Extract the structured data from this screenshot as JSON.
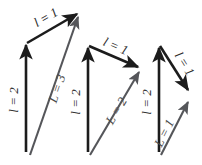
{
  "figure": {
    "type": "vector-addition-diagram-set",
    "background_color": "#ffffff",
    "component_color": "#1c1c1c",
    "resultant_color": "#55565a",
    "label_color": "#2b2b2b",
    "panel_count": 3
  },
  "panels": [
    {
      "id": "panel-1",
      "name": "vector-diagram-parallel",
      "vectors": {
        "vertical": {
          "name": "component-vertical",
          "label": "l = 2",
          "length": 2,
          "symbol": "l",
          "value": "2",
          "start": [
            26,
            152
          ],
          "end": [
            26,
            43
          ],
          "color": "#1c1c1c"
        },
        "second": {
          "name": "component-upper",
          "label": "l = 1",
          "length": 1,
          "symbol": "l",
          "value": "1",
          "start": [
            26,
            43
          ],
          "end": [
            79,
            13
          ],
          "color": "#1c1c1c"
        },
        "resultant": {
          "name": "resultant",
          "label": "L = 3",
          "length": 3,
          "symbol": "L",
          "value": "3",
          "start": [
            30,
            155
          ],
          "end": [
            79,
            14
          ],
          "color": "#55565a"
        }
      },
      "labels": {
        "vertical_label": "l = 2",
        "second_label": "l = 1",
        "resultant_label": "L = 3"
      }
    },
    {
      "id": "panel-2",
      "name": "vector-diagram-oblique",
      "vectors": {
        "vertical": {
          "name": "component-vertical",
          "label": "l = 2",
          "length": 2,
          "symbol": "l",
          "value": "2",
          "start": [
            88,
            152
          ],
          "end": [
            88,
            46
          ],
          "color": "#1c1c1c"
        },
        "second": {
          "name": "component-upper",
          "label": "l = 1",
          "length": 1,
          "symbol": "l",
          "value": "1",
          "start": [
            88,
            46
          ],
          "end": [
            140,
            68
          ],
          "color": "#1c1c1c"
        },
        "resultant": {
          "name": "resultant",
          "label": "L = 2",
          "length": 2,
          "symbol": "L",
          "value": "2",
          "start": [
            90,
            155
          ],
          "end": [
            141,
            69
          ],
          "color": "#55565a"
        }
      },
      "labels": {
        "vertical_label": "l = 2",
        "second_label": "l = 1",
        "resultant_label": "L = 2"
      }
    },
    {
      "id": "panel-3",
      "name": "vector-diagram-opposed",
      "vectors": {
        "vertical": {
          "name": "component-vertical",
          "label": "l = 2",
          "length": 2,
          "symbol": "l",
          "value": "2",
          "start": [
            159,
            152
          ],
          "end": [
            159,
            46
          ],
          "color": "#1c1c1c"
        },
        "second": {
          "name": "component-upper",
          "label": "l = 1",
          "length": 1,
          "symbol": "l",
          "value": "1",
          "start": [
            159,
            46
          ],
          "end": [
            191,
            95
          ],
          "color": "#1c1c1c"
        },
        "resultant": {
          "name": "resultant",
          "label": "L = 1",
          "length": 1,
          "symbol": "L",
          "value": "1",
          "start": [
            161,
            155
          ],
          "end": [
            191,
            100
          ],
          "color": "#55565a"
        }
      },
      "labels": {
        "vertical_label": "l = 2",
        "second_label": "l = 1",
        "resultant_label": "L = 1"
      }
    }
  ]
}
